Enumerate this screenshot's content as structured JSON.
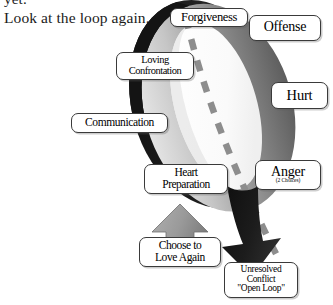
{
  "page": {
    "background": "#ffffff",
    "width": 333,
    "height": 305
  },
  "body_text": {
    "line_partial": "yet.",
    "line_main": "Look at the loop again."
  },
  "diagram": {
    "colors": {
      "ring_dark": "#1a1a1a",
      "ring_mid": "#6e6e6e",
      "ring_light": "#b9b9b9",
      "ring_highlight": "#e9e9e9",
      "arrow_up": "#9a9a9a",
      "arrow_down": "#1c1c1c",
      "dash_line": "#8d8d8d",
      "callout_border": "#3a3a3a",
      "callout_fill": "#ffffff",
      "text": "#000000"
    },
    "labels": [
      {
        "id": "forgiveness",
        "lines": [
          "Forgiveness"
        ]
      },
      {
        "id": "offense",
        "lines": [
          "Offense"
        ]
      },
      {
        "id": "hurt",
        "lines": [
          "Hurt"
        ]
      },
      {
        "id": "anger",
        "lines": [
          "Anger"
        ],
        "sub": "(2 Choices)"
      },
      {
        "id": "loving",
        "lines": [
          "Loving",
          "Confrontation"
        ]
      },
      {
        "id": "communication",
        "lines": [
          "Communication"
        ]
      },
      {
        "id": "heart",
        "lines": [
          "Heart",
          "Preparation"
        ]
      },
      {
        "id": "choose",
        "lines": [
          "Choose to",
          "Love Again"
        ]
      },
      {
        "id": "unresolved",
        "lines": [
          "Unresolved",
          "Conflict",
          "\"Open Loop\""
        ]
      }
    ],
    "label_text": {
      "forgiveness": "Forgiveness",
      "offense": "Offense",
      "hurt": "Hurt",
      "anger": "Anger",
      "anger_sub": "(2 Choices)",
      "loving_l1": "Loving",
      "loving_l2": "Confrontation",
      "communication": "Communication",
      "heart_l1": "Heart",
      "heart_l2": "Preparation",
      "choose_l1": "Choose to",
      "choose_l2": "Love Again",
      "unresolved_l1": "Unresolved",
      "unresolved_l2": "Conflict",
      "unresolved_l3": "\"Open Loop\""
    },
    "arrows": [
      {
        "id": "arrow-up-choose",
        "direction": "up",
        "tone": "light"
      },
      {
        "id": "arrow-down-conflict",
        "direction": "down",
        "tone": "dark"
      }
    ]
  }
}
